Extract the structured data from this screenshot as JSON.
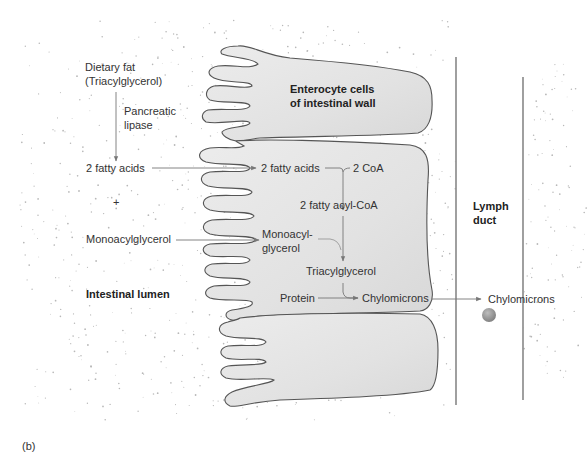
{
  "figure": {
    "panel_label": "(b)",
    "colors": {
      "background": "#ffffff",
      "cell_fill": "#e6e6e6",
      "cell_outline": "#555555",
      "arrow": "#777777",
      "duct_wall": "#888888",
      "chylomicron_particle": "#9a9a9a",
      "stipple": "#b8b8b8"
    }
  },
  "lumen": {
    "region_label": "Intestinal lumen",
    "dietary_fat": "Dietary fat",
    "triacylglycerol_paren": "(Triacylglycerol)",
    "enzyme_line1": "Pancreatic",
    "enzyme_line2": "lipase",
    "fatty_acids": "2 fatty acids",
    "plus": "+",
    "monoacylglycerol": "Monoacylglycerol"
  },
  "enterocyte": {
    "title_line1": "Enterocyte cells",
    "title_line2": "of intestinal wall",
    "fatty_acids": "2 fatty acids",
    "coa": "2 CoA",
    "fatty_acyl_coa": "2 fatty acyl-CoA",
    "monoacyl_line1": "Monoacyl-",
    "monoacyl_line2": "glycerol",
    "triacylglycerol": "Triacylglycerol",
    "protein": "Protein",
    "chylomicrons": "Chylomicrons"
  },
  "lymph": {
    "title_line1": "Lymph",
    "title_line2": "duct",
    "chylomicrons": "Chylomicrons"
  }
}
